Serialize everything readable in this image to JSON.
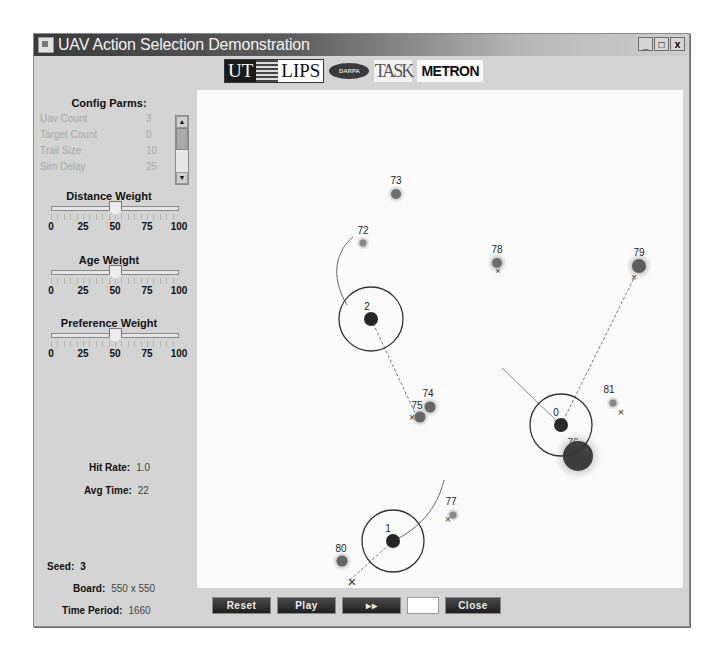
{
  "window": {
    "title": "UAV Action Selection Demonstration",
    "controls": {
      "minimize": "_",
      "maximize": "□",
      "close": "x"
    }
  },
  "logos": {
    "ut": "UT",
    "lips": "LIPS",
    "darpa": "DARPA",
    "task": "TASK",
    "metron": "METRON"
  },
  "config": {
    "title": "Config Parms:",
    "rows": [
      {
        "label": "Uav Count",
        "value": "3"
      },
      {
        "label": "Target Count",
        "value": "0"
      },
      {
        "label": "Trail Size",
        "value": "10"
      },
      {
        "label": "Sim Delay",
        "value": "25"
      }
    ]
  },
  "sliders": [
    {
      "title": "Distance Weight",
      "value": 50,
      "ticks": [
        "0",
        "25",
        "50",
        "75",
        "100"
      ]
    },
    {
      "title": "Age Weight",
      "value": 50,
      "ticks": [
        "0",
        "25",
        "50",
        "75",
        "100"
      ]
    },
    {
      "title": "Preference Weight",
      "value": 50,
      "ticks": [
        "0",
        "25",
        "50",
        "75",
        "100"
      ]
    }
  ],
  "stats": {
    "hit_rate_label": "Hit Rate:",
    "hit_rate": "1.0",
    "avg_time_label": "Avg Time:",
    "avg_time": "22",
    "seed_label": "Seed:",
    "seed": "3",
    "board_label": "Board:",
    "board": "550 x 550",
    "time_period_label": "Time Period:",
    "time_period": "1660"
  },
  "board": {
    "targets": [
      {
        "id": "73",
        "x": 199,
        "y": 104,
        "r": 5,
        "halo": 9
      },
      {
        "id": "72",
        "x": 166,
        "y": 153,
        "r": 4,
        "halo": 7
      },
      {
        "id": "78",
        "x": 300,
        "y": 173,
        "r": 5,
        "halo": 9
      },
      {
        "id": "79",
        "x": 442,
        "y": 176,
        "r": 7,
        "halo": 13
      },
      {
        "id": "74",
        "x": 233,
        "y": 317,
        "r": 6,
        "halo": 10
      },
      {
        "id": "75",
        "x": 223,
        "y": 327,
        "r": 6,
        "halo": 10
      },
      {
        "id": "81",
        "x": 416,
        "y": 313,
        "r": 4,
        "halo": 7
      },
      {
        "id": "76",
        "x": 381,
        "y": 366,
        "r": 15,
        "halo": 24
      },
      {
        "id": "77",
        "x": 256,
        "y": 425,
        "r": 4,
        "halo": 7
      },
      {
        "id": "80",
        "x": 145,
        "y": 471,
        "r": 6,
        "halo": 10
      }
    ],
    "uavs": [
      {
        "id": "2",
        "x": 174,
        "y": 229,
        "r": 32
      },
      {
        "id": "0",
        "x": 364,
        "y": 335,
        "r": 31
      },
      {
        "id": "1",
        "x": 196,
        "y": 451,
        "r": 31
      }
    ]
  },
  "buttons": {
    "reset": "Reset",
    "play": "Play",
    "fast_forward": "▸▸",
    "step_value": "",
    "close": "Close"
  }
}
